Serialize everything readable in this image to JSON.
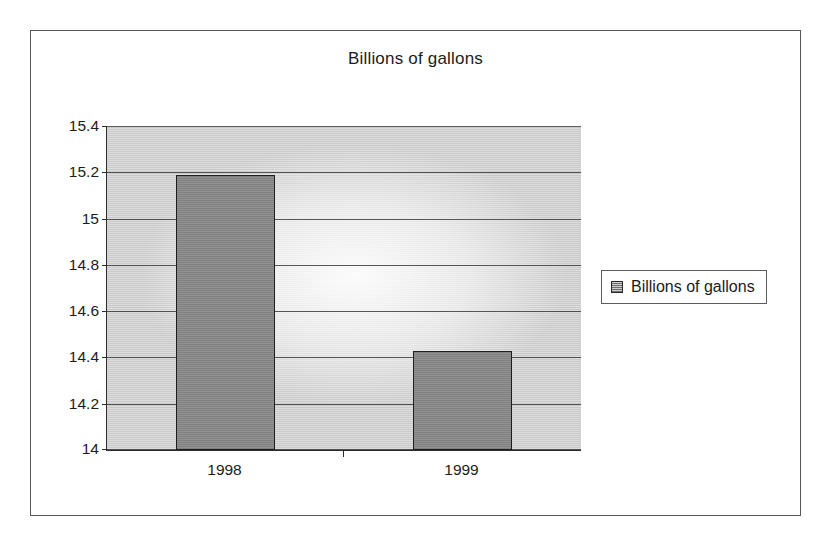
{
  "frame": {
    "border_color": "#55585c",
    "background": "#ffffff"
  },
  "chart_data": {
    "type": "bar",
    "title": "Billions of gallons",
    "xlabel": "",
    "ylabel": "",
    "categories": [
      "1998",
      "1999"
    ],
    "series": [
      {
        "name": "Billions of gallons",
        "values": [
          15.19,
          14.43
        ],
        "color": "#8a8a8a"
      }
    ],
    "ylim": [
      14,
      15.4
    ],
    "ytick_labels": [
      "15.4",
      "15.2",
      "15",
      "14.8",
      "14.6",
      "14.4",
      "14.2",
      "14"
    ],
    "ytick_values": [
      15.4,
      15.2,
      15.0,
      14.8,
      14.6,
      14.4,
      14.2,
      14.0
    ],
    "grid": true,
    "grid_color": "#3a3a3a",
    "plot_background": "#d3d3d3",
    "legend_position": "right",
    "legend_entries": [
      "Billions of gallons"
    ]
  },
  "legend": {
    "swatch_icon": "series-swatch-icon",
    "label": "Billions of gallons"
  }
}
